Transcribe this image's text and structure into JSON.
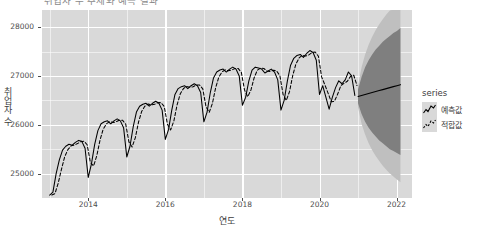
{
  "chart_data": {
    "type": "line",
    "title": "취업자 수 추세와 예측 결과",
    "xlabel": "연도",
    "ylabel": "취업자 수",
    "xlim": [
      2012.8,
      2022.4
    ],
    "ylim": [
      24500,
      28350
    ],
    "xticks": [
      "2014",
      "2016",
      "2018",
      "2020",
      "2022"
    ],
    "xtick_values": [
      2014,
      2016,
      2018,
      2020,
      2022
    ],
    "yticks": [
      "25000",
      "26000",
      "27000",
      "28000"
    ],
    "ytick_values": [
      25000,
      26000,
      27000,
      28000
    ],
    "grid": true,
    "legend_position": "right",
    "legend_title": "series",
    "series": [
      {
        "name": "예측값",
        "label": "예측값",
        "style": "solid",
        "color": "#000000",
        "x": [
          2013.0,
          2013.083,
          2013.167,
          2013.25,
          2013.333,
          2013.417,
          2013.5,
          2013.583,
          2013.667,
          2013.75,
          2013.833,
          2013.917,
          2014.0,
          2014.083,
          2014.167,
          2014.25,
          2014.333,
          2014.417,
          2014.5,
          2014.583,
          2014.667,
          2014.75,
          2014.833,
          2014.917,
          2015.0,
          2015.083,
          2015.167,
          2015.25,
          2015.333,
          2015.417,
          2015.5,
          2015.583,
          2015.667,
          2015.75,
          2015.833,
          2015.917,
          2016.0,
          2016.083,
          2016.167,
          2016.25,
          2016.333,
          2016.417,
          2016.5,
          2016.583,
          2016.667,
          2016.75,
          2016.833,
          2016.917,
          2017.0,
          2017.083,
          2017.167,
          2017.25,
          2017.333,
          2017.417,
          2017.5,
          2017.583,
          2017.667,
          2017.75,
          2017.833,
          2017.917,
          2018.0,
          2018.083,
          2018.167,
          2018.25,
          2018.333,
          2018.417,
          2018.5,
          2018.583,
          2018.667,
          2018.75,
          2018.833,
          2018.917,
          2019.0,
          2019.083,
          2019.167,
          2019.25,
          2019.333,
          2019.417,
          2019.5,
          2019.583,
          2019.667,
          2019.75,
          2019.833,
          2019.917,
          2020.0,
          2020.083,
          2020.167,
          2020.25,
          2020.333,
          2020.417,
          2020.5,
          2020.583,
          2020.667,
          2020.75,
          2020.833,
          2020.917
        ],
        "values": [
          24560,
          24620,
          25000,
          25280,
          25480,
          25560,
          25600,
          25580,
          25640,
          25680,
          25660,
          25520,
          24920,
          25200,
          25600,
          25880,
          26020,
          26060,
          26080,
          26020,
          26080,
          26120,
          26080,
          25940,
          25340,
          25560,
          25960,
          26260,
          26380,
          26420,
          26440,
          26380,
          26440,
          26480,
          26440,
          26300,
          25700,
          25900,
          26300,
          26620,
          26740,
          26780,
          26800,
          26740,
          26800,
          26840,
          26800,
          26660,
          26060,
          26260,
          26660,
          26960,
          27080,
          27120,
          27140,
          27080,
          27140,
          27180,
          27140,
          27000,
          26400,
          26560,
          26900,
          27120,
          27180,
          27160,
          27140,
          27060,
          27100,
          27140,
          27080,
          26920,
          26300,
          26500,
          26900,
          27220,
          27360,
          27420,
          27440,
          27380,
          27460,
          27520,
          27480,
          27320,
          26620,
          26800,
          26560,
          26320,
          26560,
          26760,
          26900,
          26840,
          26920,
          27080,
          27000,
          26600
        ]
      },
      {
        "name": "적합값",
        "label": "적합값",
        "style": "dashed",
        "color": "#000000",
        "note": "dashed fitted line tracks the solid series with a slight lag"
      }
    ],
    "forecast": {
      "name": "예측값",
      "start_x": 2021.0,
      "end_x": 2022.1,
      "point_forecast": [
        26580,
        26600,
        26620,
        26640,
        26660,
        26680,
        26700,
        26720,
        26740,
        26760,
        26780,
        26800,
        26820
      ],
      "ci_80_label": "80%",
      "ci_95_label": "95%",
      "ci_80_color": "#7f7f7f",
      "ci_95_color": "#bfbfbf",
      "ci_80_lower": [
        26440,
        26220,
        26060,
        25940,
        25840,
        25760,
        25680,
        25620,
        25560,
        25500,
        25460,
        25420,
        25380
      ],
      "ci_80_upper": [
        26720,
        26980,
        27180,
        27320,
        27440,
        27540,
        27620,
        27700,
        27760,
        27820,
        27880,
        27920,
        27980
      ],
      "ci_95_lower": [
        26360,
        26020,
        25800,
        25620,
        25480,
        25360,
        25260,
        25160,
        25080,
        25000,
        24940,
        24880,
        24820
      ],
      "ci_95_upper": [
        26800,
        27180,
        27440,
        27640,
        27800,
        27940,
        28060,
        28160,
        28260,
        28340,
        28360,
        28360,
        28360
      ]
    }
  },
  "legend": {
    "title": "series",
    "items": [
      {
        "label": "예측값",
        "style": "solid"
      },
      {
        "label": "적합값",
        "style": "dashed"
      }
    ]
  },
  "colors": {
    "panel_bg": "#d9d9d9",
    "gridline": "#ffffff",
    "line": "#000000",
    "band_inner": "#7f7f7f",
    "band_outer": "#bfbfbf",
    "text": "#4d4d4d"
  }
}
